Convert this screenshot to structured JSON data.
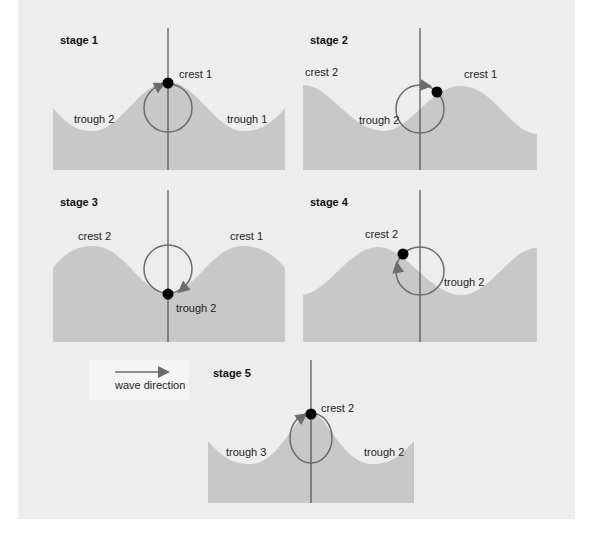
{
  "colors": {
    "background_panel": "#ededed",
    "water": "#c8c8c8",
    "orbit": "#6b6b6b",
    "particle": "#000000",
    "axis": "#333333"
  },
  "legend": {
    "label": "wave direction",
    "arrow": "right-arrow"
  },
  "stages": [
    {
      "id": 1,
      "title": "stage 1",
      "labels": {
        "a": "crest 1",
        "b": "trough 2",
        "c": "trough 1"
      },
      "particle_position": "top of orbit at crest 1"
    },
    {
      "id": 2,
      "title": "stage 2",
      "labels": {
        "a": "crest 2",
        "b": "trough 2",
        "c": "crest 1"
      },
      "particle_position": "upper-right of orbit"
    },
    {
      "id": 3,
      "title": "stage 3",
      "labels": {
        "a": "crest 2",
        "b": "crest 1",
        "c": "trough 2"
      },
      "particle_position": "bottom of orbit at trough 2"
    },
    {
      "id": 4,
      "title": "stage 4",
      "labels": {
        "a": "crest 2",
        "b": "trough 2"
      },
      "particle_position": "upper-left of orbit"
    },
    {
      "id": 5,
      "title": "stage 5",
      "labels": {
        "a": "crest 2",
        "b": "trough 3",
        "c": "trough 2"
      },
      "particle_position": "top of orbit at crest 2"
    }
  ]
}
